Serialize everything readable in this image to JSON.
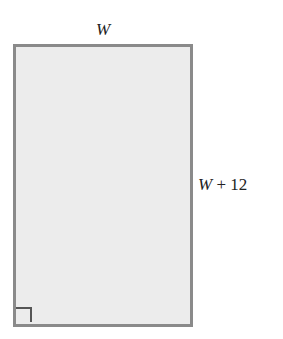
{
  "diagram": {
    "shape": "rectangle",
    "top_label_var": "W",
    "side_label_var": "W",
    "side_label_rest": " + 12",
    "right_angle_marker": "bottom-left",
    "colors": {
      "fill": "#ececec",
      "border": "#8a8a8a",
      "marker": "#555555",
      "text": "#222222"
    }
  }
}
